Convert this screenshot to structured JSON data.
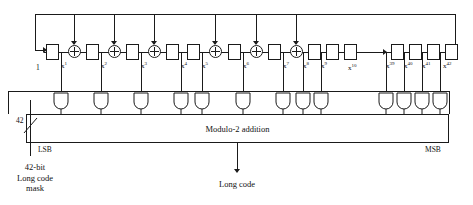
{
  "diagram": {
    "input_label": "1",
    "mask": {
      "bus_width": "42",
      "lsb_label": "LSB",
      "msb_label": "MSB",
      "caption_line1": "42-bit",
      "caption_line2": "Long code",
      "caption_line3": "mask"
    },
    "adder": {
      "label": "Modulo-2 addition"
    },
    "output": {
      "label": "Long code"
    },
    "ellipsis_tap": "x",
    "ellipsis_tap_exp": "10",
    "taps": [
      {
        "base": "x",
        "exp": "1"
      },
      {
        "base": "x",
        "exp": "2"
      },
      {
        "base": "x",
        "exp": "3"
      },
      {
        "base": "x",
        "exp": "4"
      },
      {
        "base": "x",
        "exp": "5"
      },
      {
        "base": "x",
        "exp": "6"
      },
      {
        "base": "x",
        "exp": "7"
      },
      {
        "base": "x",
        "exp": "8"
      },
      {
        "base": "x",
        "exp": "9"
      },
      {
        "base": "x",
        "exp": "39"
      },
      {
        "base": "x",
        "exp": "40"
      },
      {
        "base": "x",
        "exp": "41"
      },
      {
        "base": "x",
        "exp": "42"
      }
    ],
    "colors": {
      "ink": "#1a1a1a",
      "paper": "#ffffff"
    }
  }
}
